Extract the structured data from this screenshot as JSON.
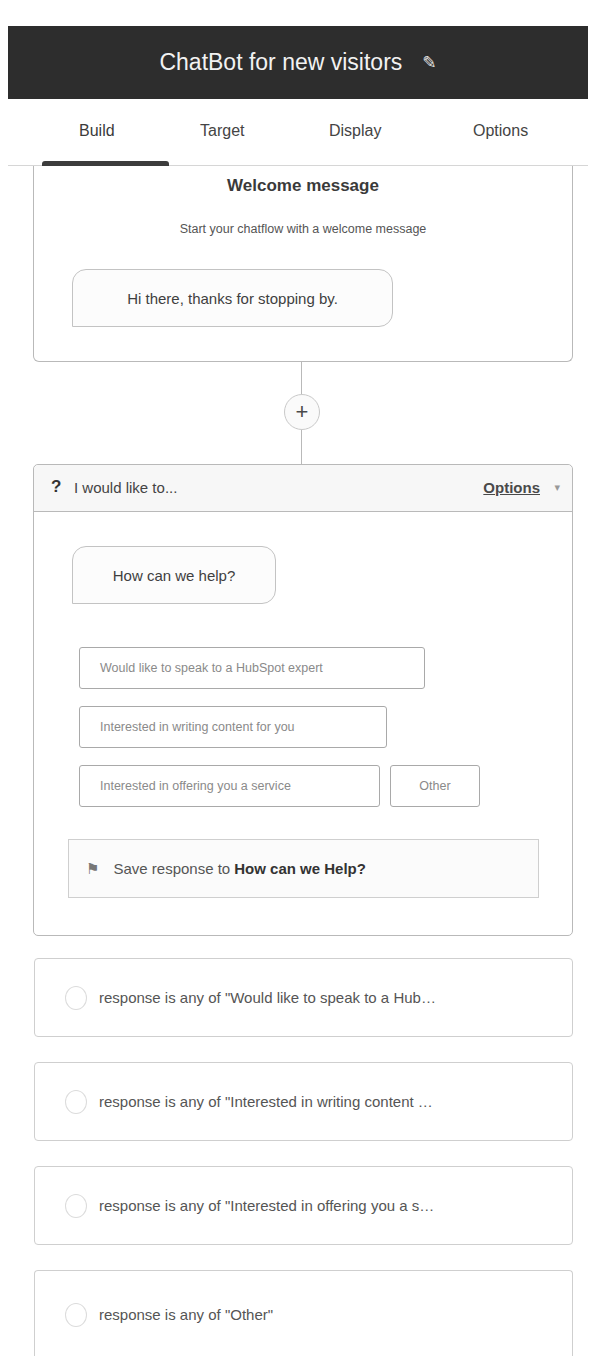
{
  "header": {
    "title": "ChatBot for new visitors",
    "edit_icon": "pencil-icon",
    "edit_glyph": "✎"
  },
  "tabs": [
    {
      "label": "Build",
      "active": true
    },
    {
      "label": "Target",
      "active": false
    },
    {
      "label": "Display",
      "active": false
    },
    {
      "label": "Options",
      "active": false
    }
  ],
  "welcome": {
    "title": "Welcome message",
    "subtitle": "Start your chatflow with a welcome message",
    "message": "Hi there, thanks for stopping by."
  },
  "add_step": {
    "icon": "plus-icon",
    "glyph": "+"
  },
  "question": {
    "icon_glyph": "?",
    "title": "I would like to...",
    "options_label": "Options",
    "caret_glyph": "▾",
    "message": "How can we help?",
    "choices": [
      "Would like to speak to a HubSpot expert",
      "Interested in writing content for you",
      "Interested in offering you a service",
      "Other"
    ],
    "save_prefix": "Save response to",
    "save_property": "How can we Help?",
    "flag_glyph": "⚑"
  },
  "branches": [
    "response is any of \"Would like to speak to a Hub…",
    "response is any of \"Interested in writing content …",
    "response is any of \"Interested in offering you a s…",
    "response is any of \"Other\""
  ]
}
